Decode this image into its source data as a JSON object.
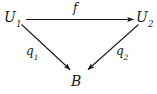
{
  "diagram": {
    "type": "commutative-triangle",
    "colors": {
      "background": "#ffffff",
      "stroke": "#1a1a1a",
      "text": "#1a1a1a"
    },
    "objects": [
      {
        "id": "u1",
        "base": "U",
        "subscript": "1",
        "position": "top-left"
      },
      {
        "id": "u2",
        "base": "U",
        "subscript": "2",
        "position": "top-right"
      },
      {
        "id": "b",
        "base": "B",
        "subscript": "",
        "position": "bottom-center"
      }
    ],
    "morphisms": [
      {
        "id": "f",
        "base": "f",
        "subscript": "",
        "from": "u1",
        "to": "u2",
        "direction": "horizontal-right"
      },
      {
        "id": "q1",
        "base": "q",
        "subscript": "1",
        "from": "u1",
        "to": "b",
        "direction": "diagonal-down-right"
      },
      {
        "id": "q2",
        "base": "q",
        "subscript": "2",
        "from": "u2",
        "to": "b",
        "direction": "diagonal-down-left"
      }
    ]
  }
}
